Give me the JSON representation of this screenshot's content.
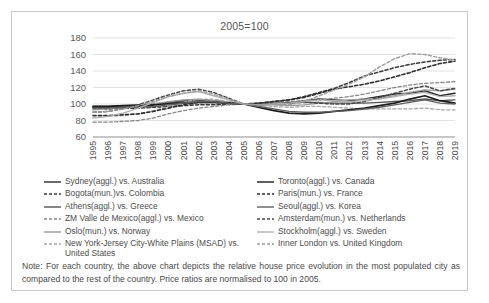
{
  "figure": {
    "title": "2005=100",
    "note": "Note: For each country, the above chart depicts the relative house price evolution in the most populated city as compared to the rest of the country. Price ratios are normalised to 100 in 2005."
  },
  "chart_data": {
    "type": "line",
    "title": "2005=100",
    "xlabel": "",
    "ylabel": "",
    "ylim": [
      60,
      180
    ],
    "yticks": [
      60,
      80,
      100,
      120,
      140,
      160,
      180
    ],
    "grid": "horizontal",
    "legend_position": "below",
    "x": [
      1995,
      1996,
      1997,
      1998,
      1999,
      2000,
      2001,
      2002,
      2003,
      2004,
      2005,
      2006,
      2007,
      2008,
      2009,
      2010,
      2011,
      2012,
      2013,
      2014,
      2015,
      2016,
      2017,
      2018,
      2019
    ],
    "xtick_labels": [
      "1995",
      "1996",
      "1997",
      "1998",
      "1999",
      "2000",
      "2001",
      "2002",
      "2003",
      "2004",
      "2005",
      "2006",
      "2007",
      "2008",
      "2009",
      "2010",
      "2011",
      "2012",
      "2013",
      "2014",
      "2015",
      "2016",
      "2017",
      "2018",
      "2019"
    ],
    "series": [
      {
        "name": "Sydney(aggl.) vs. Australia",
        "style": "solid",
        "color": "#2a2a2a",
        "width": 1.5,
        "values": [
          96,
          96,
          97,
          97,
          99,
          101,
          103,
          105,
          104,
          102,
          100,
          99,
          100,
          101,
          104,
          106,
          105,
          104,
          106,
          109,
          112,
          113,
          116,
          110,
          113
        ]
      },
      {
        "name": "Bogota(mun.)vs. Colombia",
        "style": "dashed",
        "color": "#3a3a3a",
        "width": 1.5,
        "values": [
          94,
          94,
          95,
          95,
          96,
          97,
          98,
          99,
          99,
          100,
          100,
          101,
          103,
          105,
          109,
          114,
          119,
          126,
          134,
          139,
          144,
          148,
          151,
          153,
          154
        ]
      },
      {
        "name": "Athens(aggl.) vs. Greece",
        "style": "solid",
        "color": "#555555",
        "width": 1.4,
        "values": [
          97,
          97,
          98,
          99,
          100,
          102,
          104,
          105,
          104,
          102,
          100,
          100,
          101,
          102,
          102,
          102,
          101,
          101,
          101,
          102,
          103,
          104,
          106,
          104,
          105
        ]
      },
      {
        "name": "ZM Valle de Mexico(aggl.) vs. Mexico",
        "style": "dashed",
        "color": "#888888",
        "width": 1.3,
        "values": [
          78,
          78,
          79,
          80,
          83,
          88,
          92,
          95,
          97,
          99,
          100,
          101,
          102,
          103,
          104,
          105,
          107,
          109,
          112,
          116,
          120,
          123,
          125,
          126,
          127
        ]
      },
      {
        "name": "Oslo(mun.) vs. Norway",
        "style": "solid",
        "color": "#9a9a9a",
        "width": 1.3,
        "values": [
          93,
          94,
          96,
          98,
          100,
          103,
          105,
          106,
          104,
          102,
          100,
          99,
          99,
          98,
          99,
          101,
          103,
          105,
          106,
          107,
          110,
          114,
          117,
          116,
          118
        ]
      },
      {
        "name": "New York-Jersey City-White Plains (MSAD) vs. United States",
        "style": "dashed",
        "color": "#a8a8a8",
        "width": 1.3,
        "values": [
          84,
          85,
          86,
          88,
          92,
          97,
          102,
          106,
          106,
          103,
          100,
          98,
          97,
          96,
          97,
          97,
          96,
          95,
          94,
          94,
          94,
          94,
          95,
          93,
          93
        ]
      },
      {
        "name": "Toronto(aggl.) vs. Canada",
        "style": "solid",
        "color": "#1c1c1c",
        "width": 1.7,
        "values": [
          97,
          97,
          98,
          98,
          99,
          100,
          101,
          102,
          102,
          101,
          100,
          96,
          92,
          89,
          88,
          89,
          91,
          93,
          95,
          98,
          101,
          106,
          110,
          104,
          101
        ]
      },
      {
        "name": "Paris(mun.) vs. France",
        "style": "dashed",
        "color": "#2e2e2e",
        "width": 1.6,
        "values": [
          86,
          86,
          87,
          88,
          91,
          95,
          99,
          102,
          102,
          101,
          100,
          101,
          103,
          105,
          108,
          113,
          118,
          121,
          124,
          128,
          133,
          138,
          144,
          149,
          152
        ]
      },
      {
        "name": "Seoul(aggl.) vs. Korea",
        "style": "solid",
        "color": "#606060",
        "width": 1.4,
        "values": [
          95,
          95,
          96,
          96,
          97,
          99,
          101,
          103,
          103,
          101,
          100,
          97,
          94,
          91,
          90,
          90,
          91,
          92,
          94,
          96,
          99,
          102,
          105,
          101,
          100
        ]
      },
      {
        "name": "Amsterdam(mun.) vs. Netherlands",
        "style": "dashed",
        "color": "#4a4a4a",
        "width": 1.5,
        "values": [
          90,
          91,
          94,
          99,
          105,
          111,
          116,
          118,
          114,
          107,
          100,
          99,
          100,
          101,
          102,
          101,
          100,
          100,
          103,
          108,
          113,
          118,
          122,
          116,
          119
        ]
      },
      {
        "name": "Stockholm(aggl.) vs. Sweden",
        "style": "solid",
        "color": "#b0b0b0",
        "width": 1.3,
        "values": [
          83,
          85,
          89,
          95,
          102,
          109,
          113,
          115,
          110,
          105,
          100,
          99,
          100,
          101,
          103,
          105,
          104,
          103,
          104,
          106,
          109,
          112,
          114,
          109,
          110
        ]
      },
      {
        "name": "Inner London vs. United Kingdom",
        "style": "dashed",
        "color": "#9e9e9e",
        "width": 1.4,
        "values": [
          90,
          91,
          94,
          98,
          103,
          109,
          113,
          116,
          112,
          106,
          100,
          99,
          100,
          99,
          103,
          110,
          117,
          124,
          133,
          145,
          155,
          161,
          160,
          156,
          153
        ]
      }
    ]
  },
  "legend": {
    "left_column": [
      {
        "label": "Sydney(aggl.) vs. Australia",
        "style": "solid",
        "color": "#2a2a2a"
      },
      {
        "label": "Bogota(mun.)vs. Colombia",
        "style": "dashed",
        "color": "#3a3a3a"
      },
      {
        "label": "Athens(aggl.) vs. Greece",
        "style": "solid",
        "color": "#555555"
      },
      {
        "label": "ZM Valle de Mexico(aggl.) vs. Mexico",
        "style": "dashed",
        "color": "#888888"
      },
      {
        "label": "Oslo(mun.) vs. Norway",
        "style": "solid",
        "color": "#9a9a9a"
      },
      {
        "label": "New York-Jersey City-White Plains (MSAD) vs. United States",
        "style": "dashed",
        "color": "#a8a8a8"
      }
    ],
    "right_column": [
      {
        "label": "Toronto(aggl.) vs. Canada",
        "style": "solid",
        "color": "#1c1c1c"
      },
      {
        "label": "Paris(mun.) vs. France",
        "style": "dashed",
        "color": "#2e2e2e"
      },
      {
        "label": "Seoul(aggl.) vs. Korea",
        "style": "solid",
        "color": "#606060"
      },
      {
        "label": "Amsterdam(mun.) vs. Netherlands",
        "style": "dashed",
        "color": "#4a4a4a"
      },
      {
        "label": "Stockholm(aggl.) vs. Sweden",
        "style": "solid",
        "color": "#b0b0b0"
      },
      {
        "label": "Inner London vs. United Kingdom",
        "style": "dashed",
        "color": "#9e9e9e"
      }
    ]
  }
}
